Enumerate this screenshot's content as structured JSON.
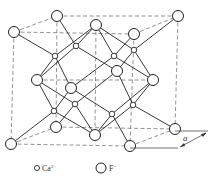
{
  "figure": {
    "lattice_label": "a",
    "legend": [
      {
        "symbol": "small-circle",
        "ion": "Ca",
        "charge": "2+"
      },
      {
        "symbol": "large-circle",
        "ion": "F",
        "charge": "−"
      }
    ]
  },
  "colors": {
    "stroke": "#222222",
    "dashed": "#666666",
    "background": "#ffffff"
  },
  "nodes": {
    "large": [
      {
        "id": "tbl",
        "x": 57,
        "y": 16
      },
      {
        "id": "tfl",
        "x": 14,
        "y": 32
      },
      {
        "id": "tbr",
        "x": 178,
        "y": 16
      },
      {
        "id": "tfr",
        "x": 134,
        "y": 34
      },
      {
        "id": "top",
        "x": 96,
        "y": 25
      },
      {
        "id": "left",
        "x": 37,
        "y": 80
      },
      {
        "id": "front",
        "x": 71,
        "y": 88
      },
      {
        "id": "back",
        "x": 117,
        "y": 71
      },
      {
        "id": "right",
        "x": 153,
        "y": 80
      },
      {
        "id": "bbl",
        "x": 56,
        "y": 127
      },
      {
        "id": "bfl",
        "x": 11,
        "y": 144
      },
      {
        "id": "bbr",
        "x": 175,
        "y": 129
      },
      {
        "id": "bfr",
        "x": 130,
        "y": 146
      },
      {
        "id": "bottom",
        "x": 95,
        "y": 135
      }
    ],
    "small": [
      {
        "id": "s1",
        "x": 76,
        "y": 46
      },
      {
        "id": "s2",
        "x": 55,
        "y": 56
      },
      {
        "id": "s3",
        "x": 114,
        "y": 56
      },
      {
        "id": "s4",
        "x": 134,
        "y": 50
      },
      {
        "id": "s5",
        "x": 75,
        "y": 104
      },
      {
        "id": "s6",
        "x": 54,
        "y": 111
      },
      {
        "id": "s7",
        "x": 112,
        "y": 114
      },
      {
        "id": "s8",
        "x": 133,
        "y": 105
      }
    ]
  }
}
